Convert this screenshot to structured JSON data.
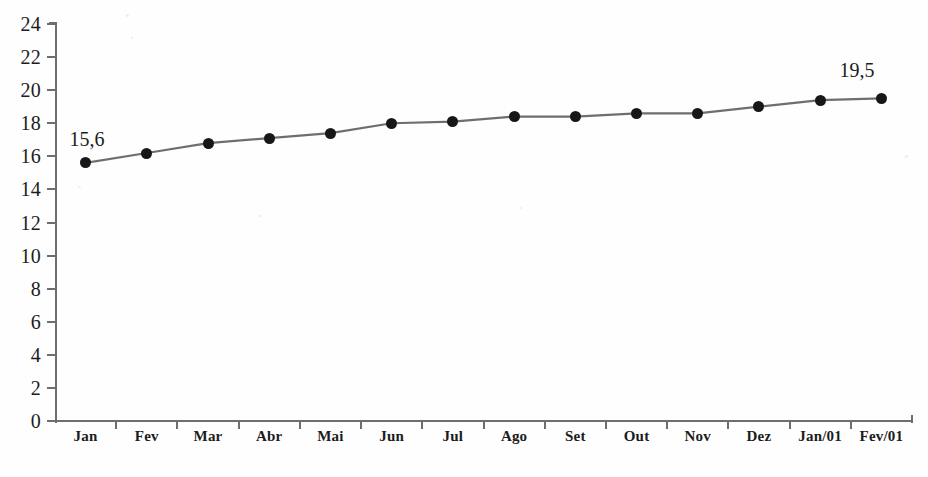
{
  "chart_data": {
    "type": "line",
    "title": "",
    "subtitle": "",
    "xlabel": "",
    "ylabel": "",
    "categories": [
      "Jan",
      "Fev",
      "Mar",
      "Abr",
      "Mai",
      "Jun",
      "Jul",
      "Ago",
      "Set",
      "Out",
      "Nov",
      "Dez",
      "Jan/01",
      "Fev/01"
    ],
    "values": [
      15.6,
      16.2,
      16.8,
      17.1,
      17.4,
      18.0,
      18.1,
      18.4,
      18.4,
      18.6,
      18.6,
      19.0,
      19.4,
      19.5
    ],
    "series": [
      {
        "name": "",
        "values": [
          15.6,
          16.2,
          16.8,
          17.1,
          17.4,
          18.0,
          18.1,
          18.4,
          18.4,
          18.6,
          18.6,
          19.0,
          19.4,
          19.5
        ]
      }
    ],
    "ylim": [
      0,
      24
    ],
    "yticks": [
      0,
      2,
      4,
      6,
      8,
      10,
      12,
      14,
      16,
      18,
      20,
      22,
      24
    ],
    "ytick_labels": [
      "0",
      "2",
      "4",
      "6",
      "8",
      "10",
      "12",
      "14",
      "16",
      "18",
      "20",
      "22",
      "24"
    ],
    "grid": false,
    "legend": null,
    "legend_position": "none",
    "annotations": [
      {
        "text": "15,6",
        "category": "Jan",
        "value": 15.6
      },
      {
        "text": "19,5",
        "category": "Fev/01",
        "value": 19.5
      }
    ],
    "marker": "filled-circle",
    "line_color": "#6e6e6e",
    "marker_color": "#171717",
    "axis_color": "#6e6e6e",
    "text_color": "#1c1c1c",
    "background_color": "#fefefe",
    "decimal_separator": ","
  }
}
